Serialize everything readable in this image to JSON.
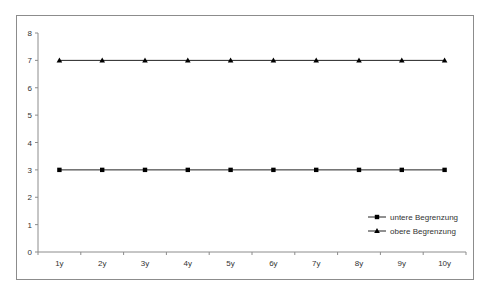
{
  "chart_data": {
    "type": "line",
    "title": "",
    "xlabel": "",
    "ylabel": "",
    "categories": [
      "1y",
      "2y",
      "3y",
      "4y",
      "5y",
      "6y",
      "7y",
      "8y",
      "9y",
      "10y"
    ],
    "series": [
      {
        "name": "untere Begrenzung",
        "marker": "square",
        "values": [
          3,
          3,
          3,
          3,
          3,
          3,
          3,
          3,
          3,
          3
        ]
      },
      {
        "name": "obere Begrenzung",
        "marker": "triangle",
        "values": [
          7,
          7,
          7,
          7,
          7,
          7,
          7,
          7,
          7,
          7
        ]
      }
    ],
    "ylim": [
      0,
      8
    ],
    "yticks": [
      0,
      1,
      2,
      3,
      4,
      5,
      6,
      7,
      8
    ],
    "grid": false,
    "legend_position": "lower right"
  }
}
